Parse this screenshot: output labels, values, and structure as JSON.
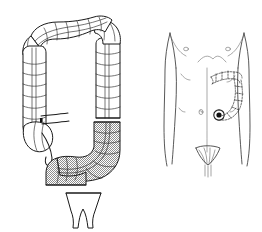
{
  "figure": {
    "background_color": "#ffffff",
    "line_color": "#1a1a1a",
    "shading_color": "#9a9a9a",
    "width": 262,
    "height": 232
  },
  "panels": [
    {
      "id": "colon-diagram",
      "name": "large-intestine-diagram",
      "position": "left",
      "description": "Frontal view of the large intestine drawn with haustral segmentation and taenia coli"
    },
    {
      "id": "torso-diagram",
      "name": "abdominal-torso-diagram",
      "position": "right",
      "description": "Anterior male torso outline with dashed colon projection and stoma marking on the left lower quadrant"
    }
  ],
  "colon_parts": [
    {
      "key": "cecum",
      "label": "Cecum",
      "shaded": false
    },
    {
      "key": "appendix",
      "label": "Vermiform appendix",
      "shaded": false
    },
    {
      "key": "ileum",
      "label": "Terminal ileum",
      "shaded": false
    },
    {
      "key": "ascending_colon",
      "label": "Ascending colon",
      "shaded": false
    },
    {
      "key": "hepatic_flexure",
      "label": "Hepatic flexure",
      "shaded": false
    },
    {
      "key": "transverse_colon",
      "label": "Transverse colon",
      "shaded": false
    },
    {
      "key": "splenic_flexure",
      "label": "Splenic flexure",
      "shaded": false
    },
    {
      "key": "descending_colon",
      "label": "Descending colon",
      "shaded": false
    },
    {
      "key": "sigmoid_colon",
      "label": "Sigmoid colon",
      "shaded": true
    },
    {
      "key": "rectum",
      "label": "Rectum and anal canal",
      "shaded": false
    }
  ],
  "torso_parts": [
    {
      "key": "nipple_right",
      "label": "Right nipple"
    },
    {
      "key": "nipple_left",
      "label": "Left nipple"
    },
    {
      "key": "costal_margin",
      "label": "Costal margin"
    },
    {
      "key": "umbilicus",
      "label": "Umbilicus"
    },
    {
      "key": "stoma_site",
      "label": "Stoma site, left lower quadrant"
    },
    {
      "key": "pubic_region",
      "label": "Pubic region"
    },
    {
      "key": "colon_overlay",
      "label": "Projected sigmoid colon outline"
    }
  ],
  "annotations": {
    "shaded_segment_note": "Sigmoid colon shown with stippled shading",
    "detached_segment_note": "Rectum and anal canal shown detached below the resection line"
  }
}
